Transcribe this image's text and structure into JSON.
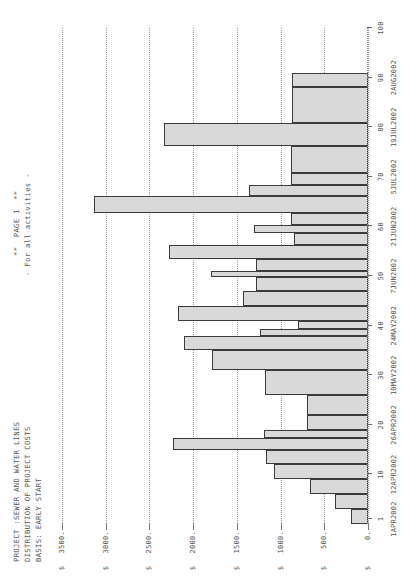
{
  "header": {
    "title_line1": "PROJECT :SEWER AND WATER LINES",
    "title_line2": "DISTRIBUTION OF PROJECT COSTS",
    "title_line3": "BASIS: EARLY START",
    "page_label": "**  PAGE 1  **",
    "scope_label": "- For all activities -"
  },
  "chart_data": {
    "type": "bar",
    "title": "DISTRIBUTION OF PROJECT COSTS",
    "subtitle": "PROJECT :SEWER AND WATER LINES",
    "xlabel": "",
    "ylabel": "$",
    "ylim": [
      0,
      3500
    ],
    "grid": true,
    "legend": null,
    "y_ticks": [
      0,
      500,
      1000,
      1500,
      2000,
      2500,
      3000,
      3500
    ],
    "y_tick_labels": [
      "0.",
      "500.",
      "1000.",
      "1500.",
      "2000.",
      "2500.",
      "3000.",
      "3500."
    ],
    "y_tick_prefix": "$",
    "x_ticks": [
      1,
      10,
      20,
      30,
      40,
      50,
      60,
      70,
      80,
      90,
      100
    ],
    "x_tick_labels": [
      "1",
      "10",
      "20",
      "30",
      "40",
      "50",
      "60",
      "70",
      "80",
      "90",
      "100"
    ],
    "x_date_ticks": [
      1,
      10,
      20,
      30,
      40,
      50,
      60,
      70,
      80,
      90
    ],
    "x_date_labels": [
      "1APR2002",
      "12APR2002",
      "26APR2002",
      "10MAY2002",
      "24MAY2002",
      "7JUN2002",
      "21JUN2002",
      "5JUL2002",
      "19JUL2002",
      "2AUG2002"
    ],
    "xlim": [
      0,
      100
    ],
    "x": [
      1.5,
      4.5,
      7.5,
      10.5,
      13.5,
      16.5,
      18.2,
      20.5,
      24.0,
      28.5,
      33.0,
      36.5,
      38.6,
      40.2,
      42.5,
      45.5,
      48.0,
      50.4,
      52.5,
      55.0,
      57.6,
      59.4,
      61.5,
      64.5,
      67.3,
      69.6,
      73.5,
      78.5,
      84.5,
      89.5,
      93.5
    ],
    "bar_starts": [
      0,
      3,
      6,
      9,
      12,
      15,
      17.4,
      19.0,
      22.0,
      26.0,
      31.0,
      35.0,
      37.9,
      39.3,
      41.0,
      44.0,
      47.0,
      49.7,
      51.0,
      53.5,
      56.2,
      58.6,
      60.2,
      62.8,
      66.2,
      68.4,
      70.8,
      76.2,
      80.8,
      88.2,
      91.0
    ],
    "bar_ends": [
      3,
      6,
      9,
      12,
      15,
      17.4,
      19.0,
      22.0,
      26.0,
      31.0,
      35.0,
      37.9,
      39.3,
      41.0,
      44.0,
      47.0,
      49.7,
      51.0,
      53.5,
      56.2,
      58.6,
      60.2,
      62.8,
      66.2,
      68.4,
      70.8,
      76.2,
      80.8,
      88.2,
      91.0,
      96.0
    ],
    "values": [
      200,
      380,
      660,
      1070,
      1170,
      2230,
      1190,
      700,
      700,
      1180,
      1780,
      2110,
      1230,
      805,
      2170,
      1430,
      1280,
      1800,
      1280,
      2280,
      850,
      1300,
      880,
      3130,
      1360,
      880,
      880,
      2330,
      870,
      870,
      0
    ],
    "bar_count": 31,
    "units": "dollars per period"
  }
}
